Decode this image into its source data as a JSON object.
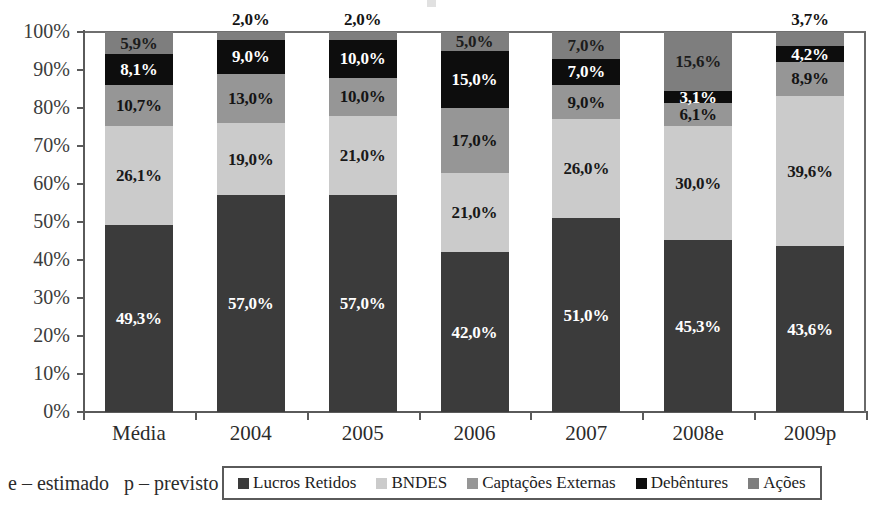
{
  "footnote": "e – estimado   p – previsto",
  "colors": {
    "lucros_retidos": "#3b3b3b",
    "bndes": "#cbcbcb",
    "captacoes_externas": "#969696",
    "debentures": "#0d0d0d",
    "acoes": "#7e7e7e",
    "axis": "#5a5a5a",
    "background": "#ffffff"
  },
  "chart_data": {
    "type": "bar",
    "stacked": true,
    "normalized_100_percent": true,
    "title": "",
    "subtitle": "",
    "xlabel": "",
    "ylabel": "",
    "ylim": [
      0,
      100
    ],
    "ytick_labels": [
      "0%",
      "10%",
      "20%",
      "30%",
      "40%",
      "50%",
      "60%",
      "70%",
      "80%",
      "90%",
      "100%"
    ],
    "ytick_values": [
      0,
      10,
      20,
      30,
      40,
      50,
      60,
      70,
      80,
      90,
      100
    ],
    "grid": false,
    "legend_position": "bottom",
    "categories": [
      "Média",
      "2004",
      "2005",
      "2006",
      "2007",
      "2008e",
      "2009p"
    ],
    "series": [
      {
        "name": "Lucros Retidos",
        "color": "#3b3b3b",
        "values": [
          49.3,
          57.0,
          57.0,
          42.0,
          51.0,
          45.3,
          43.6
        ],
        "labels": [
          "49,3%",
          "57,0%",
          "57,0%",
          "42,0%",
          "51,0%",
          "45,3%",
          "43,6%"
        ]
      },
      {
        "name": "BNDES",
        "color": "#cbcbcb",
        "values": [
          26.1,
          19.0,
          21.0,
          21.0,
          26.0,
          30.0,
          39.6
        ],
        "labels": [
          "26,1%",
          "19,0%",
          "21,0%",
          "21,0%",
          "26,0%",
          "30,0%",
          "39,6%"
        ]
      },
      {
        "name": "Captações Externas",
        "color": "#969696",
        "values": [
          10.7,
          13.0,
          10.0,
          17.0,
          9.0,
          6.1,
          8.9
        ],
        "labels": [
          "10,7%",
          "13,0%",
          "10,0%",
          "17,0%",
          "9,0%",
          "6,1%",
          "8,9%"
        ]
      },
      {
        "name": "Debêntures",
        "color": "#0d0d0d",
        "values": [
          8.1,
          9.0,
          10.0,
          15.0,
          7.0,
          3.1,
          4.2
        ],
        "labels": [
          "8,1%",
          "9,0%",
          "10,0%",
          "15,0%",
          "7,0%",
          "3,1%",
          "4,2%"
        ]
      },
      {
        "name": "Ações",
        "color": "#7e7e7e",
        "values": [
          5.9,
          2.0,
          2.0,
          5.0,
          7.0,
          15.6,
          3.7
        ],
        "labels": [
          "5,9%",
          "2,0%",
          "2,0%",
          "5,0%",
          "7,0%",
          "15,6%",
          "3,7%"
        ],
        "labels_outside": [
          false,
          true,
          true,
          false,
          false,
          false,
          true
        ]
      }
    ]
  }
}
